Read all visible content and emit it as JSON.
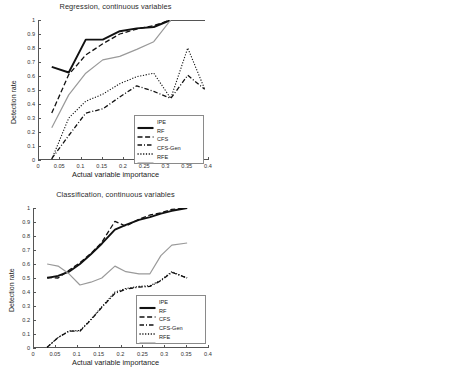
{
  "figure": {
    "panels": [
      "regression-line",
      "regression-bars",
      "classification-line",
      "classification-bars"
    ]
  },
  "legend_line": {
    "entries": [
      {
        "label": "IPE",
        "style": "solid-thick",
        "color": "#111111"
      },
      {
        "label": "RF",
        "style": "dashed",
        "color": "#111111"
      },
      {
        "label": "CFS",
        "style": "dash-dot",
        "color": "#111111"
      },
      {
        "label": "CFS-Gen",
        "style": "dotted",
        "color": "#111111"
      },
      {
        "label": "RFE",
        "style": "solid-thin",
        "color": "#9a9a9a"
      }
    ]
  },
  "legend_bar": {
    "entries": [
      {
        "label": "detection rate",
        "color": "#b3b3b3"
      },
      {
        "label": "false alarms",
        "color": "#111111"
      }
    ]
  },
  "chart_data": [
    {
      "id": "regression-line",
      "type": "line",
      "title": "Regression, continuous variables",
      "xlabel": "Actual variable importance",
      "ylabel": "Detection rate",
      "xlim": [
        0,
        0.4
      ],
      "ylim": [
        0,
        1
      ],
      "xticks": [
        0,
        0.05,
        0.1,
        0.15,
        0.2,
        0.25,
        0.3,
        0.35,
        0.4
      ],
      "xticklabels": [
        "0",
        "0.05",
        "0.1",
        "0.15",
        "0.2",
        "0.25",
        "0.3",
        "0.35",
        "0.4"
      ],
      "yticks": [
        0,
        0.1,
        0.2,
        0.3,
        0.4,
        0.5,
        0.6,
        0.7,
        0.8,
        0.9,
        1
      ],
      "yticklabels": [
        "0",
        "0.1",
        "0.2",
        "0.3",
        "0.4",
        "0.5",
        "0.6",
        "0.7",
        "0.8",
        "0.9",
        "1"
      ],
      "grid": false,
      "legend_position": "lower-right",
      "series": [
        {
          "name": "IPE",
          "style": "solid-thick",
          "color": "#111111",
          "width": 1.9,
          "x": [
            0.03,
            0.07,
            0.11,
            0.15,
            0.19,
            0.23,
            0.27,
            0.31,
            0.35,
            0.39
          ],
          "y": [
            0.665,
            0.625,
            0.86,
            0.86,
            0.92,
            0.94,
            0.95,
            1.0,
            1.0,
            1.0
          ]
        },
        {
          "name": "RF",
          "style": "dashed",
          "color": "#111111",
          "width": 1.3,
          "x": [
            0.03,
            0.07,
            0.11,
            0.15,
            0.19,
            0.23,
            0.27,
            0.31,
            0.35,
            0.39
          ],
          "y": [
            0.335,
            0.61,
            0.75,
            0.83,
            0.9,
            0.935,
            0.96,
            1.0,
            1.0,
            1.0
          ]
        },
        {
          "name": "CFS",
          "style": "dash-dot",
          "color": "#111111",
          "width": 1.3,
          "x": [
            0.03,
            0.07,
            0.11,
            0.15,
            0.19,
            0.23,
            0.27,
            0.31,
            0.35,
            0.39
          ],
          "y": [
            0.01,
            0.175,
            0.335,
            0.365,
            0.45,
            0.53,
            0.49,
            0.44,
            0.605,
            0.505
          ]
        },
        {
          "name": "CFS-Gen",
          "style": "dotted",
          "color": "#111111",
          "width": 1.1,
          "x": [
            0.03,
            0.07,
            0.11,
            0.15,
            0.19,
            0.23,
            0.27,
            0.31,
            0.35,
            0.39
          ],
          "y": [
            0.005,
            0.3,
            0.42,
            0.47,
            0.545,
            0.595,
            0.62,
            0.44,
            0.8,
            0.505
          ]
        },
        {
          "name": "RFE",
          "style": "solid-thin",
          "color": "#9a9a9a",
          "width": 1.2,
          "x": [
            0.03,
            0.07,
            0.11,
            0.15,
            0.19,
            0.23,
            0.27,
            0.31,
            0.35,
            0.39
          ],
          "y": [
            0.23,
            0.465,
            0.62,
            0.715,
            0.74,
            0.79,
            0.845,
            1.0,
            1.0,
            1.0
          ]
        }
      ]
    },
    {
      "id": "regression-bars",
      "type": "bar",
      "title": "",
      "categories": [
        "IPE",
        "RF",
        "CFS",
        "CFS-Gen",
        "RFE"
      ],
      "ylim": [
        0,
        1
      ],
      "yticks": [
        0,
        0.1,
        0.2,
        0.3,
        0.4,
        0.5,
        0.6,
        0.7,
        0.8,
        0.9,
        1
      ],
      "yticklabels": [
        "0",
        "0.1",
        "0.2",
        "0.3",
        "0.4",
        "0.5",
        "0.6",
        "0.7",
        "0.8",
        "0.9",
        "1"
      ],
      "grid": true,
      "legend_position": "upper-right",
      "series": [
        {
          "name": "detection rate",
          "color": "#b3b3b3",
          "values": [
            0.88,
            0.845,
            0.38,
            0.455,
            0.695
          ]
        },
        {
          "name": "false alarms",
          "color": "#111111",
          "values": [
            0.045,
            0.1,
            0.01,
            0.025,
            0.3
          ]
        }
      ]
    },
    {
      "id": "classification-line",
      "type": "line",
      "title": "Classification, continuous variables",
      "xlabel": "Actual variable importance",
      "ylabel": "Detection rate",
      "xlim": [
        0,
        0.4
      ],
      "ylim": [
        0,
        1
      ],
      "xticks": [
        0,
        0.05,
        0.1,
        0.15,
        0.2,
        0.25,
        0.3,
        0.35,
        0.4
      ],
      "xticklabels": [
        "0",
        "0.05",
        "0.1",
        "0.15",
        "0.2",
        "0.25",
        "0.3",
        "0.35",
        "0.4"
      ],
      "yticks": [
        0,
        0.1,
        0.2,
        0.3,
        0.4,
        0.5,
        0.6,
        0.7,
        0.8,
        0.9,
        1
      ],
      "yticklabels": [
        "0",
        "0.1",
        "0.2",
        "0.3",
        "0.4",
        "0.5",
        "0.6",
        "0.7",
        "0.8",
        "0.9",
        "1"
      ],
      "grid": false,
      "legend_position": "lower-right",
      "series": [
        {
          "name": "IPE",
          "style": "solid-thick",
          "color": "#111111",
          "width": 1.9,
          "x": [
            0.03,
            0.055,
            0.08,
            0.105,
            0.13,
            0.155,
            0.185,
            0.21,
            0.24,
            0.265,
            0.29,
            0.315,
            0.35
          ],
          "y": [
            0.5,
            0.515,
            0.545,
            0.6,
            0.67,
            0.745,
            0.845,
            0.88,
            0.915,
            0.935,
            0.96,
            0.98,
            1.0
          ]
        },
        {
          "name": "RF",
          "style": "dashed",
          "color": "#111111",
          "width": 1.3,
          "x": [
            0.03,
            0.055,
            0.08,
            0.105,
            0.13,
            0.155,
            0.185,
            0.21,
            0.24,
            0.265,
            0.29,
            0.315,
            0.35
          ],
          "y": [
            0.505,
            0.5,
            0.555,
            0.61,
            0.675,
            0.755,
            0.905,
            0.87,
            0.92,
            0.95,
            0.965,
            0.99,
            1.0
          ]
        },
        {
          "name": "CFS",
          "style": "dash-dot",
          "color": "#111111",
          "width": 1.3,
          "x": [
            0.03,
            0.055,
            0.08,
            0.105,
            0.13,
            0.155,
            0.185,
            0.21,
            0.24,
            0.265,
            0.29,
            0.315,
            0.35
          ],
          "y": [
            0.005,
            0.075,
            0.12,
            0.12,
            0.2,
            0.29,
            0.39,
            0.42,
            0.435,
            0.44,
            0.48,
            0.54,
            0.5
          ]
        },
        {
          "name": "CFS-Gen",
          "style": "dotted",
          "color": "#111111",
          "width": 1.1,
          "x": [
            0.03,
            0.055,
            0.08,
            0.105,
            0.13,
            0.155,
            0.185,
            0.21,
            0.24,
            0.265,
            0.29,
            0.315,
            0.35
          ],
          "y": [
            0.005,
            0.075,
            0.122,
            0.125,
            0.205,
            0.295,
            0.4,
            0.425,
            0.44,
            0.445,
            0.485,
            0.545,
            0.5
          ]
        },
        {
          "name": "RFE",
          "style": "solid-thin",
          "color": "#9a9a9a",
          "width": 1.2,
          "x": [
            0.03,
            0.055,
            0.08,
            0.105,
            0.13,
            0.155,
            0.185,
            0.21,
            0.24,
            0.265,
            0.29,
            0.315,
            0.35
          ],
          "y": [
            0.6,
            0.585,
            0.53,
            0.45,
            0.47,
            0.5,
            0.585,
            0.545,
            0.53,
            0.53,
            0.66,
            0.735,
            0.75
          ]
        }
      ]
    },
    {
      "id": "classification-bars",
      "type": "bar",
      "title": "",
      "categories": [
        "IPE",
        "RF",
        "CFS",
        "CFS-Gen",
        "RFE"
      ],
      "ylim": [
        0,
        0.9
      ],
      "yticks": [
        0,
        0.1,
        0.2,
        0.3,
        0.4,
        0.5,
        0.6,
        0.7,
        0.8,
        0.9
      ],
      "yticklabels": [
        "0",
        "0.1",
        "0.2",
        "0.3",
        "0.4",
        "0.5",
        "0.6",
        "0.7",
        "0.8",
        "0.9"
      ],
      "grid": true,
      "legend_position": "upper-right",
      "series": [
        {
          "name": "detection rate",
          "color": "#b3b3b3",
          "values": [
            0.785,
            0.785,
            0.29,
            0.31,
            0.53
          ]
        },
        {
          "name": "false alarms",
          "color": "#111111",
          "values": [
            0.055,
            0.13,
            0.0,
            0.0,
            0.47
          ]
        }
      ]
    }
  ]
}
